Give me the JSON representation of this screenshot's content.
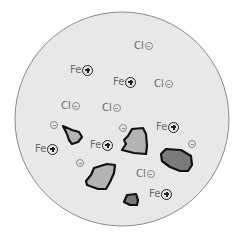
{
  "diagram": {
    "colors": {
      "circle_fill": "#e8e8e8",
      "circle_stroke": "#8a8a8a",
      "particle_light": "#b4b4b4",
      "particle_dark": "#7a7a7a",
      "particle_stroke": "#111111",
      "text": "#6a6a6a"
    },
    "ions": [
      {
        "symbol": "Cl",
        "charge": "minus",
        "x": 134,
        "y": 40
      },
      {
        "symbol": "Fe",
        "charge": "plus",
        "x": 70,
        "y": 64
      },
      {
        "symbol": "Fe",
        "charge": "plus",
        "x": 113,
        "y": 76
      },
      {
        "symbol": "Cl",
        "charge": "minus",
        "x": 154,
        "y": 78
      },
      {
        "symbol": "Cl",
        "charge": "minus",
        "x": 61,
        "y": 100
      },
      {
        "symbol": "Cl",
        "charge": "minus",
        "x": 102,
        "y": 102
      },
      {
        "symbol": "Fe",
        "charge": "plus",
        "x": 156,
        "y": 121
      },
      {
        "symbol": "Fe",
        "charge": "plus",
        "x": 35,
        "y": 143
      },
      {
        "symbol": "Fe",
        "charge": "plus",
        "x": 90,
        "y": 139
      },
      {
        "symbol": "Cl",
        "charge": "minus",
        "x": 136,
        "y": 168
      },
      {
        "symbol": "Fe",
        "charge": "plus",
        "x": 149,
        "y": 188
      }
    ],
    "free_charges": [
      {
        "charge": "minus",
        "x": 50,
        "y": 121
      },
      {
        "charge": "minus",
        "x": 119,
        "y": 124
      },
      {
        "charge": "minus",
        "x": 188,
        "y": 140
      },
      {
        "charge": "minus",
        "x": 76,
        "y": 159
      }
    ]
  }
}
